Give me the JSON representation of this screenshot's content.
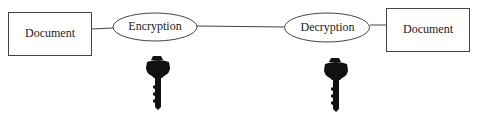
{
  "diagram": {
    "nodes": [
      {
        "id": "doc-left",
        "shape": "rectangle",
        "label": "Document"
      },
      {
        "id": "encryption",
        "shape": "ellipse",
        "label": "Encryption"
      },
      {
        "id": "decryption",
        "shape": "ellipse",
        "label": "Decryption"
      },
      {
        "id": "doc-right",
        "shape": "rectangle",
        "label": "Document"
      }
    ],
    "edges": [
      {
        "from": "doc-left",
        "to": "encryption"
      },
      {
        "from": "encryption",
        "to": "decryption"
      },
      {
        "from": "decryption",
        "to": "doc-right"
      }
    ],
    "icons": [
      {
        "name": "key-icon",
        "under": "encryption"
      },
      {
        "name": "key-icon",
        "under": "decryption"
      }
    ],
    "colors": {
      "stroke": "#333333",
      "key": "#111111"
    }
  }
}
